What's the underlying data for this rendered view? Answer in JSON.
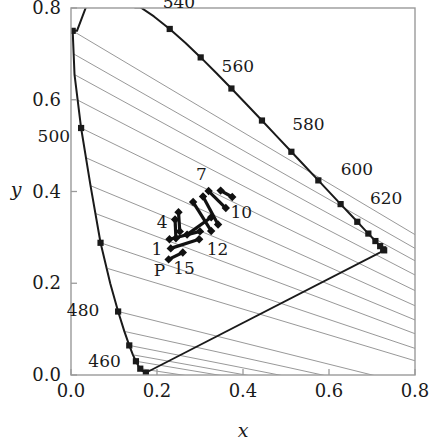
{
  "chart_data": {
    "type": "scatter",
    "title": "",
    "xlabel": "x",
    "ylabel": "y",
    "xlim": [
      0.0,
      0.8
    ],
    "ylim": [
      0.0,
      0.8
    ],
    "grid": false,
    "legend": null,
    "xticks": [
      "0.0",
      "0.2",
      "0.4",
      "0.6",
      "0.8"
    ],
    "xtick_values": [
      0.0,
      0.2,
      0.4,
      0.6,
      0.8
    ],
    "yticks": [
      "0.0",
      "0.2",
      "0.4",
      "0.6",
      "0.8"
    ],
    "ytick_values": [
      0.0,
      0.2,
      0.4,
      0.6,
      0.8
    ],
    "spectral_locus": {
      "name": "spectral-locus",
      "points": [
        [
          0.1741,
          0.005
        ],
        [
          0.1666,
          0.0089
        ],
        [
          0.1611,
          0.0138
        ],
        [
          0.1566,
          0.0203
        ],
        [
          0.151,
          0.03
        ],
        [
          0.144,
          0.044
        ],
        [
          0.1355,
          0.0645
        ],
        [
          0.1241,
          0.095
        ],
        [
          0.1096,
          0.1384
        ],
        [
          0.0913,
          0.1994
        ],
        [
          0.0687,
          0.2882
        ],
        [
          0.0454,
          0.4127
        ],
        [
          0.0235,
          0.5384
        ],
        [
          0.0082,
          0.6548
        ],
        [
          0.0039,
          0.7502
        ],
        [
          0.0139,
          0.7502
        ],
        [
          0.0389,
          0.812
        ],
        [
          0.0743,
          0.8338
        ],
        [
          0.1142,
          0.8262
        ],
        [
          0.1547,
          0.8059
        ],
        [
          0.1929,
          0.7816
        ],
        [
          0.2296,
          0.7543
        ],
        [
          0.2658,
          0.7243
        ],
        [
          0.3016,
          0.6923
        ],
        [
          0.3373,
          0.6589
        ],
        [
          0.3731,
          0.6245
        ],
        [
          0.4087,
          0.5896
        ],
        [
          0.4441,
          0.5547
        ],
        [
          0.4788,
          0.5202
        ],
        [
          0.5125,
          0.4866
        ],
        [
          0.5448,
          0.4544
        ],
        [
          0.5752,
          0.4242
        ],
        [
          0.6029,
          0.3965
        ],
        [
          0.627,
          0.3725
        ],
        [
          0.6482,
          0.3514
        ],
        [
          0.6658,
          0.334
        ],
        [
          0.6801,
          0.3197
        ],
        [
          0.6915,
          0.3083
        ],
        [
          0.7006,
          0.2993
        ],
        [
          0.7079,
          0.292
        ],
        [
          0.714,
          0.2859
        ],
        [
          0.719,
          0.2809
        ],
        [
          0.723,
          0.277
        ],
        [
          0.726,
          0.274
        ],
        [
          0.7283,
          0.2717
        ]
      ]
    },
    "locus_markers": [
      [
        0.1741,
        0.005
      ],
      [
        0.1611,
        0.0138
      ],
      [
        0.151,
        0.03
      ],
      [
        0.1355,
        0.0645
      ],
      [
        0.1096,
        0.1384
      ],
      [
        0.0687,
        0.2882
      ],
      [
        0.0235,
        0.5384
      ],
      [
        0.0039,
        0.7502
      ],
      [
        0.0743,
        0.8338
      ],
      [
        0.1547,
        0.8059
      ],
      [
        0.2296,
        0.7543
      ],
      [
        0.3016,
        0.6923
      ],
      [
        0.3731,
        0.6245
      ],
      [
        0.4441,
        0.5547
      ],
      [
        0.5125,
        0.4866
      ],
      [
        0.5752,
        0.4242
      ],
      [
        0.627,
        0.3725
      ],
      [
        0.6658,
        0.334
      ],
      [
        0.6915,
        0.3083
      ],
      [
        0.7079,
        0.292
      ],
      [
        0.719,
        0.2809
      ],
      [
        0.726,
        0.274
      ],
      [
        0.7283,
        0.2717
      ]
    ],
    "wavelength_labels": [
      {
        "text": "460",
        "x": 0.078,
        "y": 0.018,
        "anchor": "middle"
      },
      {
        "text": "480",
        "x": 0.028,
        "y": 0.128,
        "anchor": "middle"
      },
      {
        "text": "500",
        "x": -0.04,
        "y": 0.508,
        "anchor": "middle"
      },
      {
        "text": "520",
        "x": 0.089,
        "y": 0.898,
        "anchor": "middle"
      },
      {
        "text": "540",
        "x": 0.251,
        "y": 0.8,
        "anchor": "middle"
      },
      {
        "text": "560",
        "x": 0.388,
        "y": 0.66,
        "anchor": "middle"
      },
      {
        "text": "580",
        "x": 0.552,
        "y": 0.535,
        "anchor": "middle"
      },
      {
        "text": "600",
        "x": 0.665,
        "y": 0.437,
        "anchor": "middle"
      },
      {
        "text": "620",
        "x": 0.733,
        "y": 0.373,
        "anchor": "middle"
      }
    ],
    "purple_line": {
      "name": "purple-boundary",
      "from": [
        0.1741,
        0.005
      ],
      "to": [
        0.7283,
        0.2717
      ]
    },
    "iso_lines": {
      "name": "iso-lines",
      "count": 16,
      "note": "Family of straight lines fanning from the short-wavelength/left part of the locus toward the lower-right, continuing past the purple line to the plot edge.",
      "segments": [
        [
          [
            0.0039,
            0.7502
          ],
          [
            0.8,
            0.306
          ]
        ],
        [
          [
            0.006,
            0.7
          ],
          [
            0.8,
            0.276
          ]
        ],
        [
          [
            0.0082,
            0.6548
          ],
          [
            0.8,
            0.249
          ]
        ],
        [
          [
            0.014,
            0.6
          ],
          [
            0.8,
            0.218
          ]
        ],
        [
          [
            0.0235,
            0.5384
          ],
          [
            0.8,
            0.184
          ]
        ],
        [
          [
            0.034,
            0.474
          ],
          [
            0.8,
            0.151
          ]
        ],
        [
          [
            0.0454,
            0.4127
          ],
          [
            0.8,
            0.12
          ]
        ],
        [
          [
            0.057,
            0.352
          ],
          [
            0.8,
            0.09
          ]
        ],
        [
          [
            0.0687,
            0.2882
          ],
          [
            0.8,
            0.058
          ]
        ],
        [
          [
            0.086,
            0.232
          ],
          [
            0.8,
            0.031
          ]
        ],
        [
          [
            0.1096,
            0.1384
          ],
          [
            0.76,
            -0.014
          ]
        ],
        [
          [
            0.1241,
            0.095
          ],
          [
            0.73,
            -0.03
          ]
        ],
        [
          [
            0.1355,
            0.0645
          ],
          [
            0.7,
            -0.04
          ]
        ],
        [
          [
            0.144,
            0.044
          ],
          [
            0.68,
            -0.046
          ]
        ],
        [
          [
            0.151,
            0.03
          ],
          [
            0.66,
            -0.05
          ]
        ],
        [
          [
            0.1611,
            0.0138
          ],
          [
            0.64,
            -0.054
          ]
        ]
      ]
    },
    "measurement_segments": {
      "name": "measurement-segments",
      "marker": "filled-diamond",
      "note": "Short straight segments with a filled diamond at each end, clustered near the white point.",
      "segments": [
        {
          "id": "s1",
          "from": [
            0.227,
            0.252
          ],
          "to": [
            0.26,
            0.267
          ]
        },
        {
          "id": "s2",
          "from": [
            0.232,
            0.276
          ],
          "to": [
            0.298,
            0.296
          ]
        },
        {
          "id": "s3",
          "from": [
            0.229,
            0.296
          ],
          "to": [
            0.3,
            0.313
          ]
        },
        {
          "id": "s4",
          "from": [
            0.242,
            0.339
          ],
          "to": [
            0.244,
            0.298
          ]
        },
        {
          "id": "s5",
          "from": [
            0.25,
            0.355
          ],
          "to": [
            0.253,
            0.313
          ]
        },
        {
          "id": "s6",
          "from": [
            0.284,
            0.377
          ],
          "to": [
            0.326,
            0.314
          ]
        },
        {
          "id": "s7",
          "from": [
            0.307,
            0.389
          ],
          "to": [
            0.342,
            0.328
          ]
        },
        {
          "id": "s8",
          "from": [
            0.32,
            0.401
          ],
          "to": [
            0.36,
            0.364
          ]
        },
        {
          "id": "s9",
          "from": [
            0.348,
            0.402
          ],
          "to": [
            0.375,
            0.388
          ]
        },
        {
          "id": "s10",
          "from": [
            0.27,
            0.306
          ],
          "to": [
            0.326,
            0.344
          ]
        }
      ]
    },
    "segment_labels": [
      {
        "text": "1",
        "x": 0.2,
        "y": 0.262,
        "anchor": "middle"
      },
      {
        "text": "4",
        "x": 0.212,
        "y": 0.321,
        "anchor": "middle"
      },
      {
        "text": "7",
        "x": 0.303,
        "y": 0.425,
        "anchor": "middle"
      },
      {
        "text": "10",
        "x": 0.396,
        "y": 0.342,
        "anchor": "middle"
      },
      {
        "text": "12",
        "x": 0.341,
        "y": 0.262,
        "anchor": "middle"
      },
      {
        "text": "15",
        "x": 0.263,
        "y": 0.221,
        "anchor": "middle"
      },
      {
        "text": "P",
        "x": 0.206,
        "y": 0.216,
        "anchor": "middle"
      }
    ],
    "colors": {
      "locus": "#1a1a1a",
      "iso_lines": "#8c8c8c",
      "segments": "#111111",
      "frame": "#9a9a9a",
      "text": "#1a1a1a",
      "background": "#ffffff"
    }
  }
}
